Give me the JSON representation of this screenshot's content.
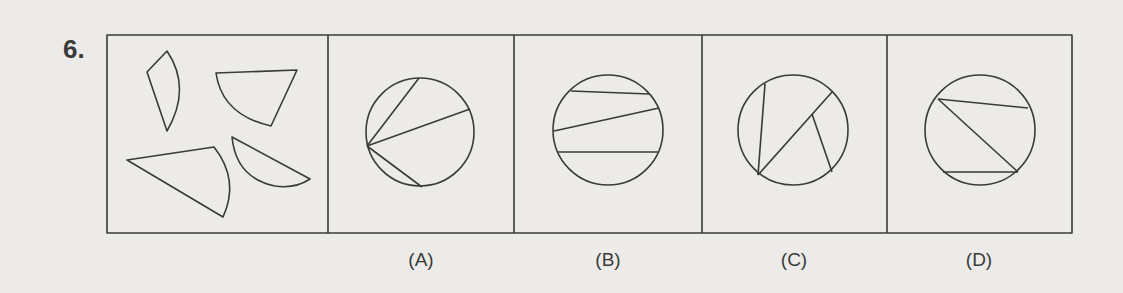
{
  "question": {
    "number": "6.",
    "figure_type": "question-figure",
    "options": [
      {
        "key": "A",
        "label": "(A)",
        "center_x": 421
      },
      {
        "key": "B",
        "label": "(B)",
        "center_x": 608
      },
      {
        "key": "C",
        "label": "(C)",
        "center_x": 794
      },
      {
        "key": "D",
        "label": "(D)",
        "center_x": 979
      }
    ]
  },
  "colors": {
    "background": "#ecebe8",
    "stroke": "#3a3a3a"
  }
}
